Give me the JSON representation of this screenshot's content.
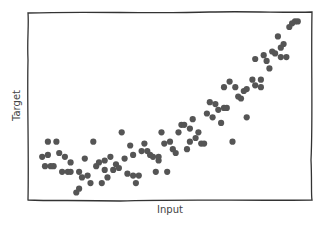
{
  "chart_data": {
    "type": "scatter",
    "title": "",
    "xlabel": "Input",
    "ylabel": "Target",
    "style": "xkcd",
    "grid": false,
    "legend": null,
    "xlim": [
      0,
      1
    ],
    "ylim": [
      0,
      1
    ],
    "ticks_visible": false,
    "marker_color": "#555555",
    "frame_color": "#333333",
    "points": [
      [
        0.05,
        0.23
      ],
      [
        0.07,
        0.24
      ],
      [
        0.07,
        0.31
      ],
      [
        0.1,
        0.31
      ],
      [
        0.06,
        0.18
      ],
      [
        0.08,
        0.18
      ],
      [
        0.09,
        0.18
      ],
      [
        0.11,
        0.25
      ],
      [
        0.13,
        0.23
      ],
      [
        0.12,
        0.15
      ],
      [
        0.14,
        0.15
      ],
      [
        0.15,
        0.15
      ],
      [
        0.15,
        0.2
      ],
      [
        0.17,
        0.04
      ],
      [
        0.18,
        0.06
      ],
      [
        0.18,
        0.15
      ],
      [
        0.19,
        0.12
      ],
      [
        0.2,
        0.22
      ],
      [
        0.21,
        0.13
      ],
      [
        0.22,
        0.09
      ],
      [
        0.23,
        0.31
      ],
      [
        0.24,
        0.18
      ],
      [
        0.25,
        0.2
      ],
      [
        0.26,
        0.09
      ],
      [
        0.27,
        0.16
      ],
      [
        0.27,
        0.21
      ],
      [
        0.28,
        0.12
      ],
      [
        0.29,
        0.23
      ],
      [
        0.3,
        0.16
      ],
      [
        0.31,
        0.19
      ],
      [
        0.32,
        0.17
      ],
      [
        0.33,
        0.36
      ],
      [
        0.34,
        0.22
      ],
      [
        0.35,
        0.14
      ],
      [
        0.36,
        0.29
      ],
      [
        0.37,
        0.13
      ],
      [
        0.37,
        0.24
      ],
      [
        0.38,
        0.09
      ],
      [
        0.39,
        0.13
      ],
      [
        0.4,
        0.26
      ],
      [
        0.41,
        0.3
      ],
      [
        0.42,
        0.26
      ],
      [
        0.43,
        0.24
      ],
      [
        0.44,
        0.23
      ],
      [
        0.45,
        0.15
      ],
      [
        0.46,
        0.21
      ],
      [
        0.46,
        0.23
      ],
      [
        0.47,
        0.36
      ],
      [
        0.48,
        0.3
      ],
      [
        0.49,
        0.15
      ],
      [
        0.5,
        0.31
      ],
      [
        0.51,
        0.27
      ],
      [
        0.52,
        0.25
      ],
      [
        0.53,
        0.36
      ],
      [
        0.54,
        0.4
      ],
      [
        0.55,
        0.4
      ],
      [
        0.56,
        0.27
      ],
      [
        0.57,
        0.31
      ],
      [
        0.57,
        0.38
      ],
      [
        0.58,
        0.43
      ],
      [
        0.59,
        0.33
      ],
      [
        0.6,
        0.36
      ],
      [
        0.61,
        0.3
      ],
      [
        0.62,
        0.3
      ],
      [
        0.63,
        0.46
      ],
      [
        0.64,
        0.52
      ],
      [
        0.65,
        0.44
      ],
      [
        0.66,
        0.51
      ],
      [
        0.67,
        0.48
      ],
      [
        0.68,
        0.41
      ],
      [
        0.69,
        0.49
      ],
      [
        0.69,
        0.6
      ],
      [
        0.7,
        0.49
      ],
      [
        0.71,
        0.63
      ],
      [
        0.72,
        0.31
      ],
      [
        0.73,
        0.6
      ],
      [
        0.74,
        0.55
      ],
      [
        0.75,
        0.54
      ],
      [
        0.76,
        0.58
      ],
      [
        0.77,
        0.44
      ],
      [
        0.77,
        0.59
      ],
      [
        0.79,
        0.64
      ],
      [
        0.8,
        0.75
      ],
      [
        0.8,
        0.61
      ],
      [
        0.82,
        0.6
      ],
      [
        0.82,
        0.64
      ],
      [
        0.83,
        0.77
      ],
      [
        0.84,
        0.74
      ],
      [
        0.85,
        0.7
      ],
      [
        0.86,
        0.79
      ],
      [
        0.87,
        0.78
      ],
      [
        0.88,
        0.87
      ],
      [
        0.89,
        0.76
      ],
      [
        0.89,
        0.81
      ],
      [
        0.9,
        0.83
      ],
      [
        0.91,
        0.76
      ],
      [
        0.92,
        0.92
      ],
      [
        0.93,
        0.94
      ],
      [
        0.94,
        0.95
      ],
      [
        0.95,
        0.95
      ]
    ]
  },
  "labels": {
    "x": "Input",
    "y": "Target"
  }
}
